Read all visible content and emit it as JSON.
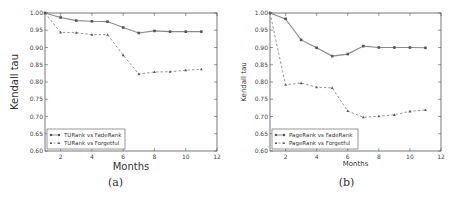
{
  "chart_data": [
    {
      "type": "line",
      "caption": "(a)",
      "title": "",
      "xlabel": "Months",
      "ylabel": "Kendall tau",
      "xlim": [
        1,
        12
      ],
      "ylim": [
        0.6,
        1.0
      ],
      "xticks": [
        2,
        4,
        6,
        8,
        10,
        12
      ],
      "yticks": [
        "0.60",
        "0.65",
        "0.70",
        "0.75",
        "0.80",
        "0.85",
        "0.90",
        "0.95",
        "1.00"
      ],
      "grid": false,
      "legend_position": "lower left",
      "x": [
        1,
        2,
        3,
        4,
        5,
        6,
        7,
        8,
        9,
        10,
        11
      ],
      "series": [
        {
          "name": "TURank vs FadeRank",
          "style": "solid",
          "marker": "square",
          "values": [
            1.0,
            0.987,
            0.978,
            0.976,
            0.975,
            0.958,
            0.942,
            0.948,
            0.946,
            0.946,
            0.946
          ]
        },
        {
          "name": "TURank vs Forgetful",
          "style": "dashed",
          "marker": "triangle",
          "values": [
            1.0,
            0.944,
            0.943,
            0.937,
            0.937,
            0.878,
            0.823,
            0.829,
            0.83,
            0.834,
            0.837
          ]
        }
      ]
    },
    {
      "type": "line",
      "caption": "(b)",
      "title": "",
      "xlabel": "Months",
      "ylabel": "Kendall tau",
      "xlim": [
        1,
        12
      ],
      "ylim": [
        0.6,
        1.0
      ],
      "xticks": [
        2,
        4,
        6,
        8,
        10,
        12
      ],
      "yticks": [
        "0.60",
        "0.65",
        "0.70",
        "0.75",
        "0.80",
        "0.85",
        "0.90",
        "0.95",
        "1.00"
      ],
      "grid": false,
      "legend_position": "lower left",
      "x": [
        1,
        2,
        3,
        4,
        5,
        6,
        7,
        8,
        9,
        10,
        11
      ],
      "series": [
        {
          "name": "PageRank vs FadeRank",
          "style": "solid",
          "marker": "square",
          "values": [
            1.0,
            0.983,
            0.922,
            0.899,
            0.875,
            0.881,
            0.904,
            0.9,
            0.9,
            0.9,
            0.899
          ]
        },
        {
          "name": "PageRank vs Forgetful",
          "style": "dashed",
          "marker": "triangle",
          "values": [
            1.0,
            0.792,
            0.797,
            0.785,
            0.783,
            0.716,
            0.698,
            0.701,
            0.705,
            0.715,
            0.719
          ]
        }
      ]
    }
  ],
  "panels": [
    {
      "caption": "(a)",
      "xlabel": "Months",
      "ylabel": "Kendall tau",
      "legend": [
        "TURank vs FadeRank",
        "TURank vs Forgetful"
      ]
    },
    {
      "caption": "(b)",
      "xlabel": "Months",
      "ylabel": "Kendall tau",
      "legend": [
        "PageRank vs FadeRank",
        "PageRank vs Forgetful"
      ]
    }
  ],
  "colors": {
    "line": "#8a8a8a",
    "marker": "#555555",
    "axis": "#555555"
  }
}
